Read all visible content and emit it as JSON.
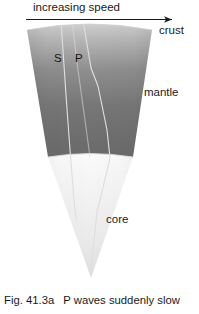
{
  "figure": {
    "caption_number": "Fig. 41.3a",
    "caption_text": "P waves suddenly slow",
    "top_arrow_label": "increasing speed",
    "arrow_direction": "right",
    "layers": [
      {
        "name": "crust",
        "label": "crust",
        "fill": "#e9e9e9"
      },
      {
        "name": "mantle",
        "label": "mantle",
        "fill": "#6e6e6e"
      },
      {
        "name": "core",
        "label": "core",
        "fill": "#efefef"
      }
    ],
    "ray_labels": [
      {
        "name": "s-wave",
        "label": "S"
      },
      {
        "name": "p-wave",
        "label": "P"
      }
    ],
    "colors": {
      "background": "#ffffff",
      "text": "#1a1a1a",
      "ray_line": "#d8d8d8",
      "arrow": "#1a1a1a",
      "wedge_top": "#e4e4e4",
      "wedge_mantle_dark": "#6a6a6a",
      "wedge_core_light": "#f2f2f2"
    }
  }
}
